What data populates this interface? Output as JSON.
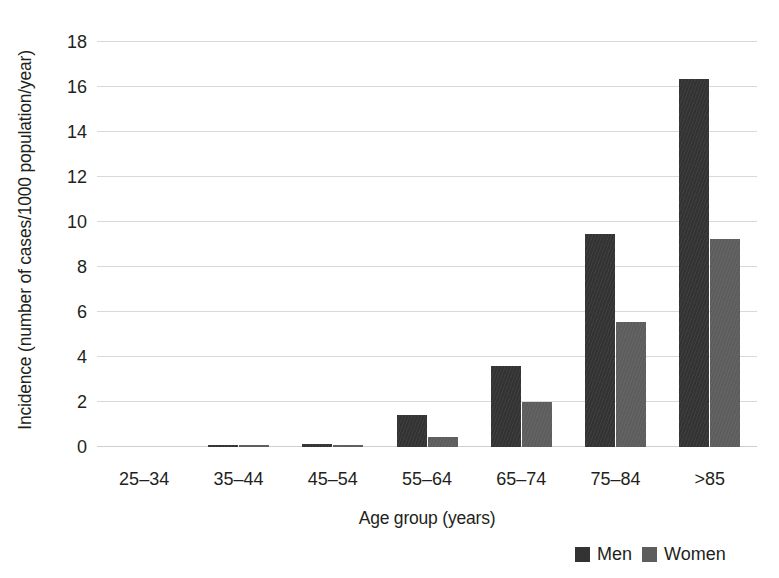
{
  "chart_data": {
    "type": "bar",
    "title": "",
    "xlabel": "Age group (years)",
    "ylabel": "Incidence (number of cases/1000 population/year)",
    "categories": [
      "25–34",
      "35–44",
      "45–54",
      "55–64",
      "65–74",
      "75–84",
      ">85"
    ],
    "series": [
      {
        "name": "Men",
        "color": "#333333",
        "values": [
          0.0,
          0.07,
          0.12,
          1.42,
          3.6,
          9.47,
          16.35
        ]
      },
      {
        "name": "Women",
        "color": "#5d5d5d",
        "values": [
          0.0,
          0.05,
          0.02,
          0.45,
          2.0,
          5.55,
          9.25
        ]
      }
    ],
    "ylim": [
      0,
      18
    ],
    "yticks": [
      0,
      2,
      4,
      6,
      8,
      10,
      12,
      14,
      16,
      18
    ],
    "ytick_labels": [
      "0",
      "2",
      "4",
      "6",
      "8",
      "10",
      "12",
      "14",
      "16",
      "18"
    ],
    "grid": true,
    "legend_position": "bottom-right",
    "legend": [
      "Men",
      "Women"
    ]
  },
  "legend": {
    "men_label": "Men",
    "women_label": "Women"
  }
}
